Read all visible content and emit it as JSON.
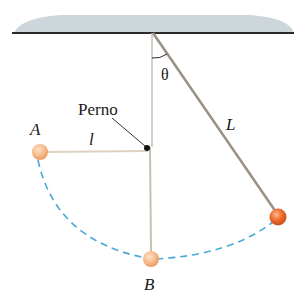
{
  "diagram": {
    "labels": {
      "peg": "Perno",
      "point_a": "A",
      "point_b": "B",
      "short_length": "l",
      "long_length": "L",
      "angle": "θ"
    },
    "colors": {
      "ceiling": "#c9d3d8",
      "string": "#bfb3a0",
      "rod": "#9a9186",
      "arc": "#4aa8d8",
      "ball_light": "#f7b98a",
      "ball_dark": "#ee6a2a"
    }
  }
}
